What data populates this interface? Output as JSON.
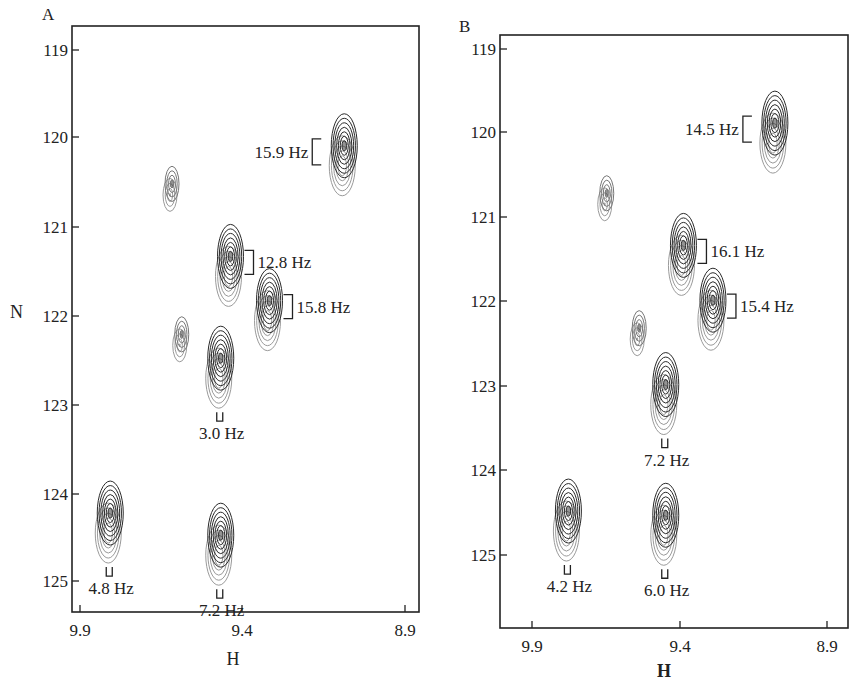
{
  "chart_data": [
    {
      "type": "scatter",
      "panel": "A",
      "title": "A",
      "xlabel": "H",
      "ylabel": "N",
      "xlim": [
        9.95,
        8.9
      ],
      "ylim": [
        125.35,
        118.7
      ],
      "xticks": [
        "9.9",
        "9.4",
        "8.9"
      ],
      "yticks": [
        "119",
        "120",
        "121",
        "122",
        "123",
        "124",
        "125"
      ],
      "peaks": [
        {
          "h": 9.09,
          "n": 120.15,
          "coupling": "15.9 Hz",
          "label_side": "left"
        },
        {
          "h": 9.62,
          "n": 120.55,
          "coupling": ""
        },
        {
          "h": 9.44,
          "n": 121.4,
          "coupling": "12.8 Hz",
          "label_side": "right"
        },
        {
          "h": 9.32,
          "n": 121.9,
          "coupling": "15.8 Hz",
          "label_side": "right"
        },
        {
          "h": 9.59,
          "n": 122.25,
          "coupling": ""
        },
        {
          "h": 9.47,
          "n": 122.55,
          "coupling": "3.0 Hz",
          "label_side": "below"
        },
        {
          "h": 9.81,
          "n": 124.3,
          "coupling": "4.8 Hz",
          "label_side": "below"
        },
        {
          "h": 9.47,
          "n": 124.55,
          "coupling": "7.2 Hz",
          "label_side": "below"
        }
      ]
    },
    {
      "type": "scatter",
      "panel": "B",
      "title": "B",
      "xlabel": "H",
      "ylabel": "",
      "xlim": [
        10.02,
        8.88
      ],
      "ylim": [
        125.85,
        118.65
      ],
      "xticks": [
        "9.9",
        "9.4",
        "8.9"
      ],
      "yticks": [
        "119",
        "120",
        "121",
        "122",
        "123",
        "124",
        "125"
      ],
      "peaks": [
        {
          "h": 9.08,
          "n": 119.95,
          "coupling": "14.5 Hz",
          "label_side": "left"
        },
        {
          "h": 9.65,
          "n": 120.75,
          "coupling": ""
        },
        {
          "h": 9.39,
          "n": 121.4,
          "coupling": "16.1 Hz",
          "label_side": "right"
        },
        {
          "h": 9.29,
          "n": 122.05,
          "coupling": "15.4 Hz",
          "label_side": "right"
        },
        {
          "h": 9.54,
          "n": 122.35,
          "coupling": ""
        },
        {
          "h": 9.45,
          "n": 123.05,
          "coupling": "7.2 Hz",
          "label_side": "below"
        },
        {
          "h": 9.78,
          "n": 124.55,
          "coupling": "4.2 Hz",
          "label_side": "below"
        },
        {
          "h": 9.45,
          "n": 124.6,
          "coupling": "6.0 Hz",
          "label_side": "below"
        }
      ]
    }
  ],
  "panels": {
    "A": {
      "letter": "A",
      "ylabel": "N",
      "xlabel": "H"
    },
    "B": {
      "letter": "B",
      "xlabel": "H"
    }
  },
  "colors": {
    "contour_dark": "#2a2a2a",
    "contour_light": "#9a9a9a",
    "frame": "#222222"
  }
}
